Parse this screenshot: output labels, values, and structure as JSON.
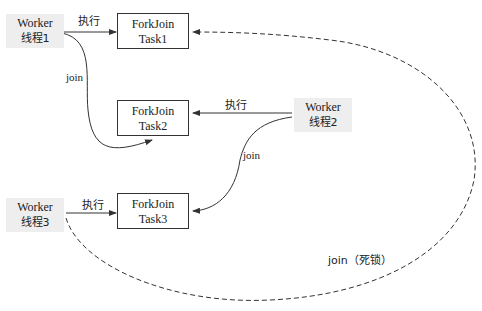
{
  "workers": [
    {
      "name": "Worker",
      "thread": "线程1"
    },
    {
      "name": "Worker",
      "thread": "线程2"
    },
    {
      "name": "Worker",
      "thread": "线程3"
    }
  ],
  "tasks": [
    {
      "line1": "ForkJoin",
      "line2": "Task1"
    },
    {
      "line1": "ForkJoin",
      "line2": "Task2"
    },
    {
      "line1": "ForkJoin",
      "line2": "Task3"
    }
  ],
  "edges": {
    "execute_label": "执行",
    "join_label": "join",
    "deadlock_label": "join（死锁）"
  },
  "colors": {
    "line": "#333333",
    "worker_bg": "#eeeeee"
  }
}
